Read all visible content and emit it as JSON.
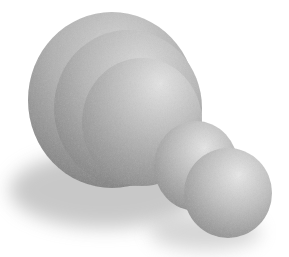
{
  "image": {
    "subject": "grayscale 3D-rendered segmented pawn-like object",
    "background_color": "#ffffff",
    "palette": {
      "highlight": "#e6e6e6",
      "mid": "#b4b4b4",
      "shade": "#8a8a8a",
      "dark": "#6e6e6e",
      "shadow": "#9a9a9a"
    },
    "parts": [
      {
        "name": "large-dome-back-layer"
      },
      {
        "name": "large-dome-middle-layer"
      },
      {
        "name": "large-dome-front-layer"
      },
      {
        "name": "medium-sphere"
      },
      {
        "name": "small-sphere"
      },
      {
        "name": "cast-shadow"
      }
    ]
  }
}
